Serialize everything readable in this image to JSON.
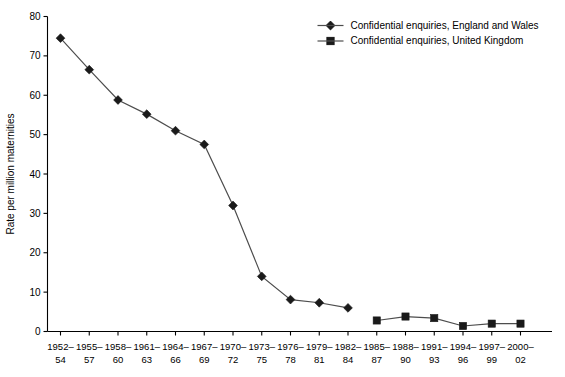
{
  "chart_data": {
    "type": "line",
    "title": "",
    "xlabel": "",
    "ylabel": "Rate per million maternities",
    "ylim": [
      0,
      80
    ],
    "yticks": [
      0,
      10,
      20,
      30,
      40,
      50,
      60,
      70,
      80
    ],
    "grid": false,
    "legend_position": "top-right",
    "categories": [
      "1952–\n54",
      "1955–\n57",
      "1958–\n60",
      "1961–\n63",
      "1964–\n66",
      "1967–\n69",
      "1970–\n72",
      "1973–\n75",
      "1976–\n78",
      "1979–\n81",
      "1982–\n84",
      "1985–\n87",
      "1988–\n90",
      "1991–\n93",
      "1994–\n96",
      "1997–\n99",
      "2000–\n02"
    ],
    "categories_top": [
      "1952–",
      "1955–",
      "1958–",
      "1961–",
      "1964–",
      "1967–",
      "1970–",
      "1973–",
      "1976–",
      "1979–",
      "1982–",
      "1985–",
      "1988–",
      "1991–",
      "1994–",
      "1997–",
      "2000–"
    ],
    "categories_bottom": [
      "54",
      "57",
      "60",
      "63",
      "66",
      "69",
      "72",
      "75",
      "78",
      "81",
      "84",
      "87",
      "90",
      "93",
      "96",
      "99",
      "02"
    ],
    "series": [
      {
        "name": "Confidential enquiries, England and Wales",
        "marker": "diamond",
        "color": "#1a1a1a",
        "values": [
          74.5,
          66.5,
          58.8,
          55.2,
          51.0,
          47.5,
          32.0,
          14.0,
          8.1,
          7.3,
          6.0,
          null,
          null,
          null,
          null,
          null,
          null
        ]
      },
      {
        "name": "Confidential enquiries, United Kingdom",
        "marker": "square",
        "color": "#1a1a1a",
        "values": [
          null,
          null,
          null,
          null,
          null,
          null,
          null,
          null,
          null,
          null,
          null,
          2.8,
          3.8,
          3.4,
          1.4,
          2.0,
          2.0
        ]
      }
    ]
  },
  "legend": {
    "items": [
      {
        "label": "Confidential enquiries, England and Wales",
        "marker": "diamond"
      },
      {
        "label": "Confidential enquiries, United Kingdom",
        "marker": "square"
      }
    ]
  },
  "axes": {
    "y_title": "Rate per million maternities"
  }
}
